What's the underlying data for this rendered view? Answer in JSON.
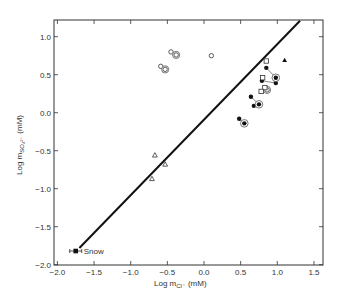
{
  "chart_data": {
    "type": "scatter",
    "title": "",
    "xlabel": "Log m_Cl⁻ (mM)",
    "xlabel_main": "Log m",
    "xlabel_sub": "Cl⁻",
    "xlabel_unit": "(mM)",
    "ylabel": "Log m_SO4²⁻ (mM)",
    "ylabel_main": "Log m",
    "ylabel_sub": "SO₄²⁻",
    "ylabel_unit": "(mM)",
    "xlim": [
      -2.0,
      1.6
    ],
    "ylim": [
      -2.0,
      1.2
    ],
    "grid": false,
    "x_ticks": [
      -2.0,
      -1.5,
      -1.0,
      -0.5,
      0.0,
      0.5,
      1.0,
      1.5
    ],
    "x_tick_labels": [
      "−2.0",
      "−1.5",
      "−1.0",
      "−0.5",
      "0.0",
      "0.5",
      "1.0",
      "1.5"
    ],
    "y_ticks": [
      -2.0,
      -1.5,
      -1.0,
      -0.5,
      0.0,
      0.5,
      1.0
    ],
    "y_tick_labels": [
      "−2.0",
      "−1.5",
      "−1.0",
      "−0.5",
      "0.0",
      "0.5",
      "1.0"
    ],
    "reference_line": {
      "x": [
        -1.7,
        1.31
      ],
      "y": [
        -1.78,
        1.21
      ]
    },
    "annotation": {
      "text": "Snow",
      "x": -1.75,
      "y": -1.82
    },
    "series": [
      {
        "name": "snow",
        "marker": "filled-square-errorbar",
        "points": [
          {
            "x": -1.75,
            "y": -1.82
          }
        ]
      },
      {
        "name": "open circles",
        "marker": "open-circle",
        "points": [
          {
            "x": -0.45,
            "y": 0.8
          },
          {
            "x": -0.59,
            "y": 0.61
          },
          {
            "x": 0.1,
            "y": 0.75
          }
        ]
      },
      {
        "name": "double open circles",
        "marker": "double-open-circle",
        "points": [
          {
            "x": -0.38,
            "y": 0.76
          },
          {
            "x": -0.53,
            "y": 0.57
          },
          {
            "x": 0.86,
            "y": 0.3
          }
        ]
      },
      {
        "name": "open triangles",
        "marker": "open-triangle",
        "points": [
          {
            "x": -0.67,
            "y": -0.56
          },
          {
            "x": -0.53,
            "y": -0.68
          },
          {
            "x": -0.71,
            "y": -0.87
          }
        ]
      },
      {
        "name": "filled circles",
        "marker": "filled-circle",
        "points": [
          {
            "x": 0.64,
            "y": 0.21
          },
          {
            "x": 0.68,
            "y": 0.09
          },
          {
            "x": 0.48,
            "y": -0.08
          },
          {
            "x": 0.85,
            "y": 0.59
          },
          {
            "x": 0.79,
            "y": 0.42
          },
          {
            "x": 0.98,
            "y": 0.39
          }
        ]
      },
      {
        "name": "double filled circles",
        "marker": "double-filled-circle",
        "points": [
          {
            "x": 0.75,
            "y": 0.11
          },
          {
            "x": 0.55,
            "y": -0.14
          },
          {
            "x": 0.98,
            "y": 0.46
          }
        ]
      },
      {
        "name": "open squares",
        "marker": "open-square",
        "points": [
          {
            "x": 0.85,
            "y": 0.68
          },
          {
            "x": 0.8,
            "y": 0.46
          },
          {
            "x": 0.83,
            "y": 0.33
          },
          {
            "x": 0.78,
            "y": 0.28
          }
        ]
      },
      {
        "name": "filled triangle",
        "marker": "filled-triangle",
        "points": [
          {
            "x": 1.1,
            "y": 0.69
          }
        ]
      }
    ],
    "connectors": [
      [
        {
          "x": 0.85,
          "y": 0.59
        },
        {
          "x": 0.98,
          "y": 0.46
        }
      ],
      [
        {
          "x": 0.79,
          "y": 0.42
        },
        {
          "x": 0.98,
          "y": 0.39
        }
      ],
      [
        {
          "x": 0.64,
          "y": 0.21
        },
        {
          "x": 0.75,
          "y": 0.11
        }
      ],
      [
        {
          "x": 0.48,
          "y": -0.08
        },
        {
          "x": 0.55,
          "y": -0.14
        }
      ]
    ]
  }
}
